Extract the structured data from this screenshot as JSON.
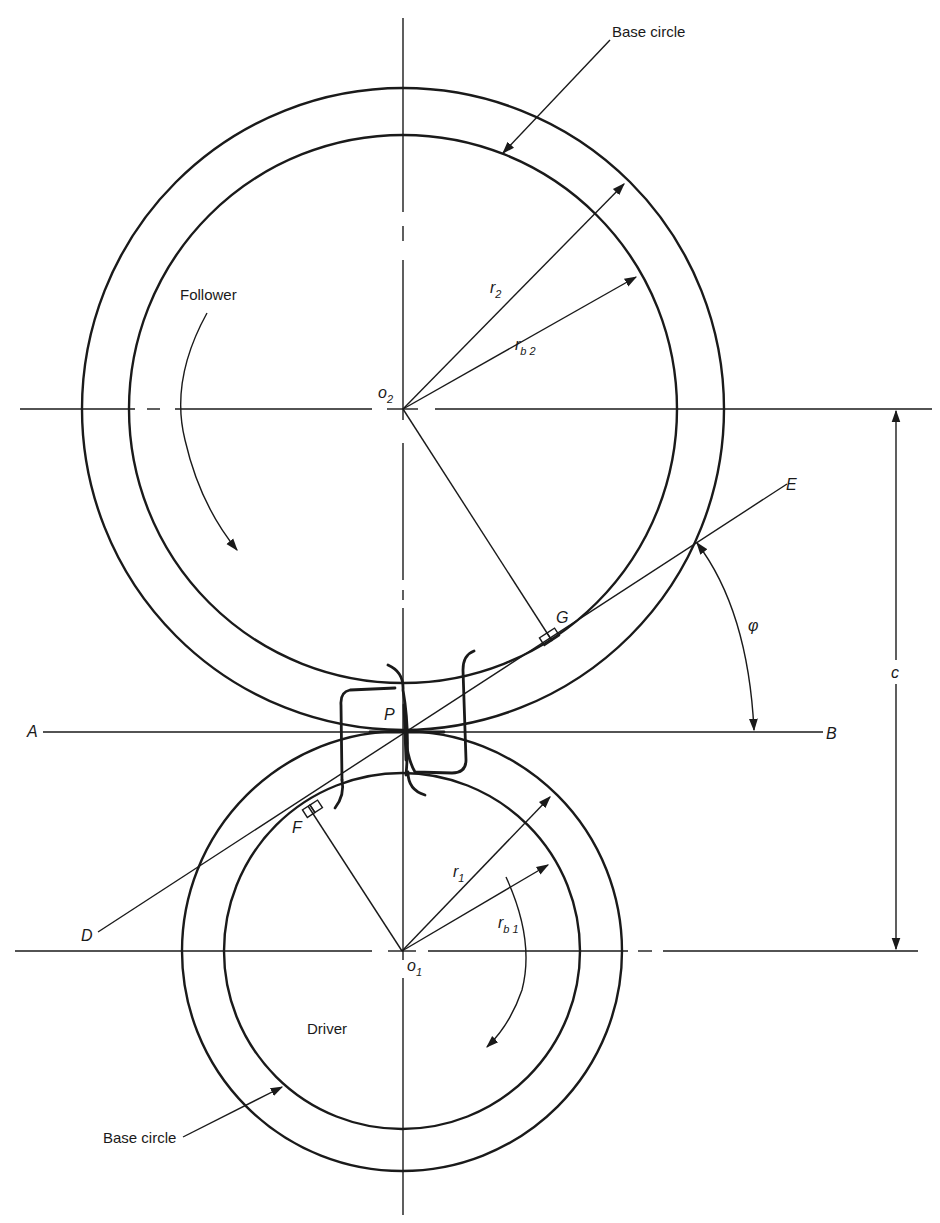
{
  "figure": {
    "background": "#ffffff",
    "ink": "#1a1a1a"
  },
  "labels": {
    "base_circle_top": "Base circle",
    "base_circle_bottom": "Base circle",
    "follower": "Follower",
    "driver": "Driver",
    "r2": "r",
    "r2_sub": "2",
    "rb2": "r",
    "rb2_sub": "b 2",
    "r1": "r",
    "r1_sub": "1",
    "rb1": "r",
    "rb1_sub": "b 1",
    "o2": "o",
    "o2_sub": "2",
    "o1": "o",
    "o1_sub": "1",
    "point_a": "A",
    "point_b": "B",
    "point_d": "D",
    "point_e": "E",
    "point_f": "F",
    "point_g": "G",
    "point_p": "P",
    "pressure_angle": "φ",
    "center_distance": "c"
  },
  "geometry": {
    "follower_gear": {
      "center": [
        403,
        409
      ],
      "pitch_radius": 320,
      "base_radius": 272
    },
    "driver_gear": {
      "center": [
        402,
        951
      ],
      "pitch_radius": 219,
      "base_radius": 177
    },
    "pitch_point": [
      406,
      732
    ],
    "line_of_action": {
      "from": [
        98,
        932
      ],
      "to": [
        787,
        484
      ]
    },
    "tangent_line_AB": {
      "from": [
        43,
        732
      ],
      "to": [
        823,
        732
      ]
    }
  }
}
